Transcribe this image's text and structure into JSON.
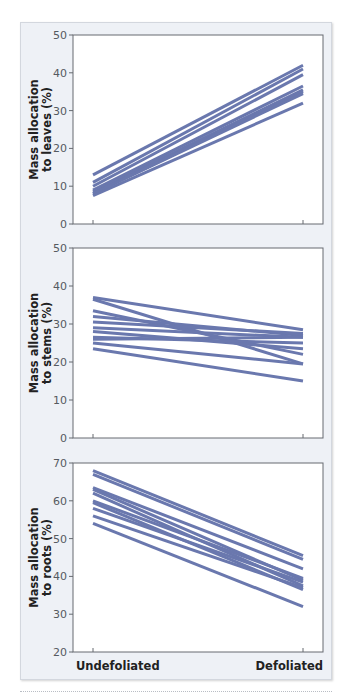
{
  "colors": {
    "line": "#6a78ae",
    "panel_bg": "#eef1f6",
    "plot_bg": "#ffffff",
    "axis": "#666a70"
  },
  "x_categories": [
    "Undefoliated",
    "Defoliated"
  ],
  "chart_data": [
    {
      "type": "line",
      "title": "",
      "xlabel": "",
      "ylabel": "Mass allocation to leaves (%)",
      "ylabel_lines": [
        "Mass allocation",
        "to leaves (%)"
      ],
      "categories": [
        "Undefoliated",
        "Defoliated"
      ],
      "ylim": [
        0,
        50
      ],
      "yticks": [
        0,
        10,
        20,
        30,
        40,
        50
      ],
      "grid": false,
      "series": [
        {
          "name": "1",
          "values": [
            13,
            42
          ]
        },
        {
          "name": "2",
          "values": [
            11,
            41
          ]
        },
        {
          "name": "3",
          "values": [
            10,
            39.5
          ]
        },
        {
          "name": "4",
          "values": [
            9,
            36.5
          ]
        },
        {
          "name": "5",
          "values": [
            8.5,
            35.5
          ]
        },
        {
          "name": "6",
          "values": [
            8,
            35
          ]
        },
        {
          "name": "7",
          "values": [
            8,
            34.5
          ]
        },
        {
          "name": "8",
          "values": [
            7.5,
            32
          ]
        }
      ]
    },
    {
      "type": "line",
      "title": "",
      "xlabel": "",
      "ylabel": "Mass allocation to stems (%)",
      "ylabel_lines": [
        "Mass allocation",
        "to stems (%)"
      ],
      "categories": [
        "Undefoliated",
        "Defoliated"
      ],
      "ylim": [
        0,
        50
      ],
      "yticks": [
        0,
        10,
        20,
        30,
        40,
        50
      ],
      "grid": false,
      "series": [
        {
          "name": "1",
          "values": [
            37,
            28.5
          ]
        },
        {
          "name": "2",
          "values": [
            36.5,
            19.5
          ]
        },
        {
          "name": "3",
          "values": [
            33.5,
            22
          ]
        },
        {
          "name": "4",
          "values": [
            32,
            27
          ]
        },
        {
          "name": "5",
          "values": [
            30.5,
            27.5
          ]
        },
        {
          "name": "6",
          "values": [
            29,
            26.5
          ]
        },
        {
          "name": "7",
          "values": [
            28,
            23.5
          ]
        },
        {
          "name": "8",
          "values": [
            26.5,
            25
          ]
        },
        {
          "name": "9",
          "values": [
            26,
            26.5
          ]
        },
        {
          "name": "10",
          "values": [
            25,
            19.5
          ]
        },
        {
          "name": "11",
          "values": [
            23.5,
            15
          ]
        }
      ]
    },
    {
      "type": "line",
      "title": "",
      "xlabel": "",
      "ylabel": "Mass allocation to roots (%)",
      "ylabel_lines": [
        "Mass allocation",
        "to roots (%)"
      ],
      "categories": [
        "Undefoliated",
        "Defoliated"
      ],
      "ylim": [
        20,
        70
      ],
      "yticks": [
        20,
        30,
        40,
        50,
        60,
        70
      ],
      "grid": false,
      "series": [
        {
          "name": "1",
          "values": [
            68,
            45.5
          ]
        },
        {
          "name": "2",
          "values": [
            67,
            44.5
          ]
        },
        {
          "name": "3",
          "values": [
            63.5,
            42
          ]
        },
        {
          "name": "4",
          "values": [
            63,
            39
          ]
        },
        {
          "name": "5",
          "values": [
            62,
            37.5
          ]
        },
        {
          "name": "6",
          "values": [
            60,
            39.5
          ]
        },
        {
          "name": "7",
          "values": [
            59.5,
            36.5
          ]
        },
        {
          "name": "8",
          "values": [
            58,
            38.5
          ]
        },
        {
          "name": "9",
          "values": [
            56,
            37
          ]
        },
        {
          "name": "10",
          "values": [
            54,
            32
          ]
        }
      ]
    }
  ]
}
